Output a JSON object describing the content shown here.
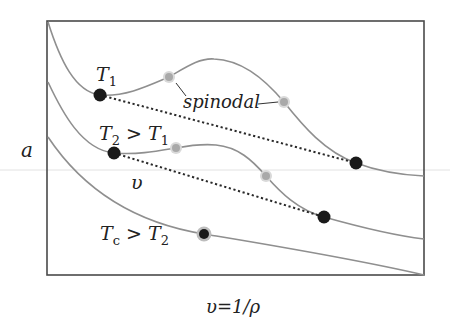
{
  "figure": {
    "y_axis_label": "a",
    "x_axis_label": "υ=1/ρ",
    "inner_label_v": "υ",
    "spinodal_label": "spinodal",
    "isotherms": [
      {
        "id": "T1",
        "label_main": "T",
        "label_sub": "1",
        "label_rest": ""
      },
      {
        "id": "T2",
        "label_main": "T",
        "label_sub": "2",
        "label_rest": " > T",
        "label_rest_sub": "1"
      },
      {
        "id": "Tc",
        "label_main": "T",
        "label_sub": "c",
        "label_rest": " > T",
        "label_rest_sub": "2"
      }
    ]
  },
  "colors": {
    "curve": "#8f8f8f",
    "binodal_point": "#1a1a1a",
    "spinodal_point": "#a9a9a9",
    "frame": "#4a4a4a"
  }
}
